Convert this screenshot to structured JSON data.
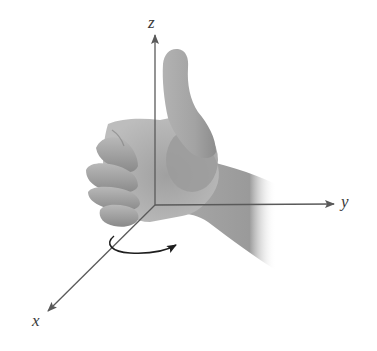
{
  "figure": {
    "axes": {
      "x": {
        "label": "x"
      },
      "y": {
        "label": "y"
      },
      "z": {
        "label": "z"
      }
    },
    "rotation_arrow": {
      "direction": "counterclockwise about z (viewed from above)"
    },
    "colors": {
      "axis": "#5a5a5a",
      "label": "#3a3a3a",
      "skin_light": "#c4c4c4",
      "skin_mid": "#9e9e9e",
      "skin_dark": "#6e6e6e",
      "arrow": "#1e1e1e",
      "background": "#ffffff"
    }
  }
}
